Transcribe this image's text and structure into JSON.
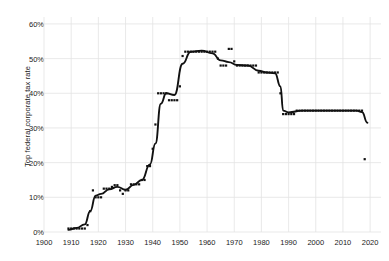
{
  "chart_data": {
    "type": "scatter",
    "title": "",
    "subtitle": "",
    "xlabel": "",
    "ylabel": "Top federal corporate tax rate",
    "xlim": [
      1900,
      2024
    ],
    "ylim": [
      0,
      62
    ],
    "grid": true,
    "legend": null,
    "xticks": [
      1900,
      1910,
      1920,
      1930,
      1940,
      1950,
      1960,
      1970,
      1980,
      1990,
      2000,
      2010,
      2020
    ],
    "xticklabels": [
      "1900",
      "1910",
      "1920",
      "1930",
      "1940",
      "1950",
      "1960",
      "1970",
      "1980",
      "1990",
      "2000",
      "2010",
      "2020"
    ],
    "yticks": [
      0,
      10,
      20,
      30,
      40,
      50,
      60
    ],
    "yticklabels": [
      "0%",
      "10%",
      "20%",
      "30%",
      "40%",
      "50%",
      "60%"
    ],
    "series": [
      {
        "name": "Top federal corporate tax rate",
        "marker": "square",
        "color": "#111111",
        "x": [
          1909,
          1910,
          1911,
          1912,
          1913,
          1914,
          1915,
          1916,
          1917,
          1918,
          1919,
          1920,
          1921,
          1922,
          1923,
          1924,
          1925,
          1926,
          1927,
          1928,
          1929,
          1930,
          1931,
          1932,
          1933,
          1934,
          1935,
          1936,
          1937,
          1938,
          1939,
          1940,
          1941,
          1942,
          1943,
          1944,
          1945,
          1946,
          1947,
          1948,
          1949,
          1950,
          1951,
          1952,
          1953,
          1954,
          1955,
          1956,
          1957,
          1958,
          1959,
          1960,
          1961,
          1962,
          1963,
          1964,
          1965,
          1966,
          1967,
          1968,
          1969,
          1970,
          1971,
          1972,
          1973,
          1974,
          1975,
          1976,
          1977,
          1978,
          1979,
          1980,
          1981,
          1982,
          1983,
          1984,
          1985,
          1986,
          1987,
          1988,
          1989,
          1990,
          1991,
          1992,
          1993,
          1994,
          1995,
          1996,
          1997,
          1998,
          1999,
          2000,
          2001,
          2002,
          2003,
          2004,
          2005,
          2006,
          2007,
          2008,
          2009,
          2010,
          2011,
          2012,
          2013,
          2014,
          2015,
          2016,
          2017,
          2018
        ],
        "y": [
          1,
          1,
          1,
          1,
          1,
          1,
          1,
          2,
          6,
          12,
          10,
          10,
          10,
          12.5,
          12.5,
          12.5,
          13,
          13.5,
          13.5,
          12,
          11,
          12,
          12,
          13.75,
          13.75,
          13.75,
          13.75,
          15,
          15,
          19,
          19,
          24,
          31,
          40,
          40,
          40,
          40,
          38,
          38,
          38,
          38,
          42,
          50.75,
          52,
          52,
          52,
          52,
          52,
          52,
          52,
          52,
          52,
          52,
          52,
          52,
          50,
          48,
          48,
          48,
          52.8,
          52.8,
          49.2,
          48,
          48,
          48,
          48,
          48,
          48,
          48,
          48,
          46,
          46,
          46,
          46,
          46,
          46,
          46,
          46,
          40,
          34,
          34,
          34,
          34,
          34,
          35,
          35,
          35,
          35,
          35,
          35,
          35,
          35,
          35,
          35,
          35,
          35,
          35,
          35,
          35,
          35,
          35,
          35,
          35,
          35,
          35,
          35,
          35,
          35,
          35,
          21
        ]
      }
    ],
    "trend_line": {
      "name": "smoothed trend",
      "color": "#111111",
      "x": [
        1909,
        1912,
        1915,
        1917,
        1919,
        1921,
        1924,
        1927,
        1930,
        1933,
        1936,
        1939,
        1941,
        1943,
        1945,
        1948,
        1951,
        1954,
        1958,
        1962,
        1965,
        1968,
        1971,
        1975,
        1979,
        1982,
        1985,
        1987,
        1988,
        1990,
        1995,
        2000,
        2005,
        2010,
        2015,
        2017,
        2019
      ],
      "y": [
        0.6,
        1.2,
        2.2,
        6.0,
        10.5,
        11.0,
        12.3,
        13.0,
        12.2,
        13.6,
        15.0,
        19.5,
        25.5,
        37.0,
        40.0,
        39.5,
        48.5,
        52.0,
        52.3,
        51.5,
        49.5,
        49.0,
        48.2,
        48.0,
        46.5,
        46.0,
        45.8,
        42.0,
        35.0,
        34.5,
        35.0,
        35.0,
        35.0,
        35.0,
        35.0,
        34.6,
        31.5
      ]
    }
  }
}
